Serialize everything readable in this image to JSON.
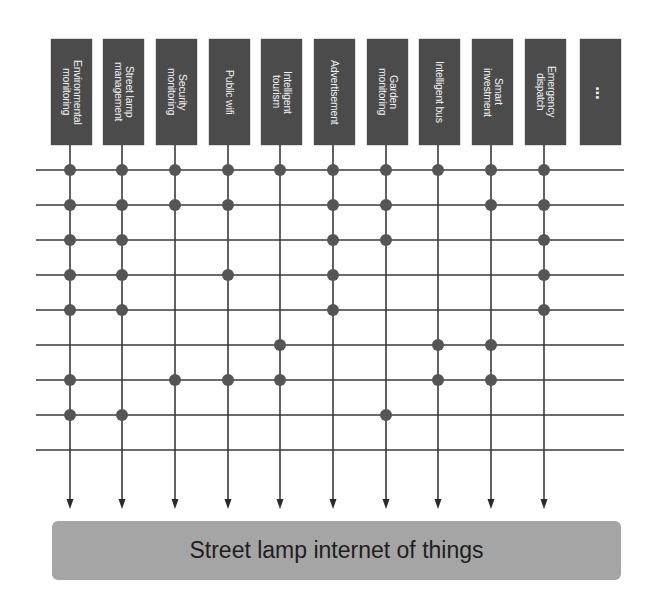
{
  "diagram": {
    "services": [
      {
        "label": "Environmental\nmonitoring",
        "x": 70
      },
      {
        "label": "Street lamp\nmanagement",
        "x": 122
      },
      {
        "label": "Security\nmonitoring",
        "x": 175
      },
      {
        "label": "Public wifi",
        "x": 228
      },
      {
        "label": "Intelligent\ntourism",
        "x": 280
      },
      {
        "label": "Advertisement",
        "x": 333
      },
      {
        "label": "Garden\nmonitoring",
        "x": 386
      },
      {
        "label": "Intelligent bus",
        "x": 438
      },
      {
        "label": "Smart\ninvestment",
        "x": 491
      },
      {
        "label": "Emergency\ndispatch",
        "x": 544
      }
    ],
    "more_label": "...",
    "bus_label": "Street lamp internet of things",
    "rows_y": [
      170,
      205,
      240,
      275,
      310,
      345,
      380,
      415,
      450
    ],
    "connections": [
      [
        1,
        2,
        3,
        4,
        5,
        6,
        7,
        8,
        9,
        10
      ],
      [
        1,
        2,
        3,
        4,
        6,
        7,
        9,
        10
      ],
      [
        1,
        2,
        6,
        7,
        10
      ],
      [
        1,
        2,
        4,
        6,
        10
      ],
      [
        1,
        2,
        6,
        10
      ],
      [
        5,
        8,
        9
      ],
      [
        1,
        3,
        4,
        5,
        8,
        9
      ],
      [
        1,
        2,
        7
      ],
      []
    ],
    "colors": {
      "box": "#4b4b4b",
      "line": "#3a3a3a",
      "dot": "#555555",
      "bus": "#a5a5a5"
    }
  }
}
